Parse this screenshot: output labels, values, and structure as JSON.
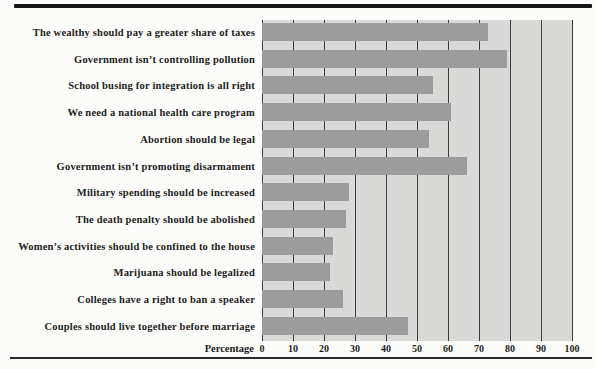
{
  "chart_data": {
    "type": "bar",
    "orientation": "horizontal",
    "title": "",
    "xlabel": "Percentage",
    "ylabel": "",
    "xlim": [
      0,
      100
    ],
    "xticks": [
      0,
      10,
      20,
      30,
      40,
      50,
      60,
      70,
      80,
      90,
      100
    ],
    "grid": "vertical gridlines at every 10 units",
    "legend": "none",
    "categories": [
      "The wealthy should pay a greater share of taxes",
      "Government isn’t controlling pollution",
      "School busing for integration is all right",
      "We need a national health care program",
      "Abortion should be legal",
      "Government isn’t promoting disarmament",
      "Military spending should be increased",
      "The death penalty should be abolished",
      "Women’s activities should be confined to the house",
      "Marijuana should be legalized",
      "Colleges have a right to ban a speaker",
      "Couples should live together before marriage"
    ],
    "values": [
      73,
      79,
      55,
      61,
      54,
      66,
      28,
      27,
      23,
      22,
      26,
      47
    ]
  },
  "axis": {
    "title": "Percentage"
  },
  "colors": {
    "bar": "#9c9c9c",
    "plot_background": "#d9d9d8",
    "gridline": "#3d3d3d",
    "top_rule": "#161616",
    "bottom_rule": "#2a2a2a"
  }
}
